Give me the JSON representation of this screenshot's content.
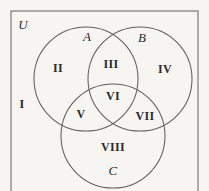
{
  "figure": {
    "kind": "venn-diagram",
    "background_color": "#f7f5f2",
    "stroke_color": "#5f5f5f",
    "text_color": "#2b2b2b"
  },
  "universe": {
    "label": "U",
    "rect": {
      "x": 11,
      "y": 11,
      "width": 187,
      "height": 186
    },
    "label_pos": {
      "x": 23,
      "y": 24
    }
  },
  "sets": [
    {
      "id": "A",
      "label": "A",
      "cx": 86,
      "cy": 79,
      "r": 52,
      "label_pos": {
        "x": 87,
        "y": 36
      }
    },
    {
      "id": "B",
      "label": "B",
      "cx": 140,
      "cy": 79,
      "r": 52,
      "label_pos": {
        "x": 142,
        "y": 37
      }
    },
    {
      "id": "C",
      "label": "C",
      "cx": 113,
      "cy": 136,
      "r": 52,
      "label_pos": {
        "x": 113,
        "y": 170
      }
    }
  ],
  "regions": [
    {
      "label": "I",
      "description": "outside-all-sets",
      "x": 22,
      "y": 104
    },
    {
      "label": "II",
      "description": "A-only",
      "x": 58,
      "y": 68
    },
    {
      "label": "III",
      "description": "A-intersect-B",
      "x": 111,
      "y": 64
    },
    {
      "label": "IV",
      "description": "B-only",
      "x": 165,
      "y": 69
    },
    {
      "label": "V",
      "description": "A-intersect-C",
      "x": 81,
      "y": 114
    },
    {
      "label": "VI",
      "description": "A-intersect-B-intersect-C",
      "x": 113,
      "y": 96
    },
    {
      "label": "VII",
      "description": "B-intersect-C",
      "x": 145,
      "y": 116
    },
    {
      "label": "VIII",
      "description": "C-only",
      "x": 113,
      "y": 147
    }
  ]
}
